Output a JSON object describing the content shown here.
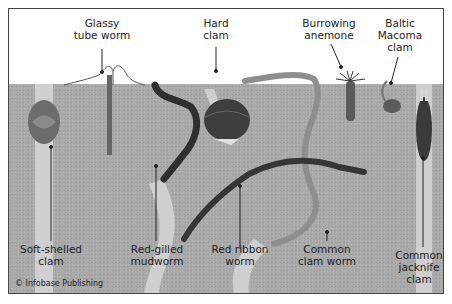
{
  "diagram": {
    "credit": "© Infobase Publishing",
    "colors": {
      "sediment": "#a9a9a9",
      "burrow": "#d6d6d6",
      "frame": "#444444",
      "label_text": "#222222"
    },
    "labels": [
      {
        "id": "glassy-tube-worm",
        "text": "Glassy\ntube worm"
      },
      {
        "id": "hard-clam",
        "text": "Hard\nclam"
      },
      {
        "id": "burrowing-anemone",
        "text": "Burrowing\nanemone"
      },
      {
        "id": "baltic-macoma-clam",
        "text": "Baltic\nMacoma\nclam"
      },
      {
        "id": "soft-shelled-clam",
        "text": "Soft-shelled\nclam"
      },
      {
        "id": "red-gilled-mudworm",
        "text": "Red-gilled\nmudworm"
      },
      {
        "id": "red-ribbon-worm",
        "text": "Red ribbon\nworm"
      },
      {
        "id": "common-clam-worm",
        "text": "Common\nclam worm"
      },
      {
        "id": "common-jacknife-clam",
        "text": "Common\njacknife\nclam"
      }
    ]
  }
}
